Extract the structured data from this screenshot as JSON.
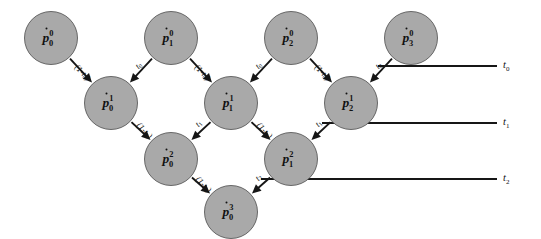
{
  "figure": {
    "name": "de-casteljau-recursion-diagram",
    "background_color": "#ffffff",
    "node_fill_color": "#a9a9a9",
    "node_stroke_color": "#5a5a5a",
    "line_color": "#161616",
    "node_radius": 26.5
  },
  "nodes": [
    {
      "id": "p00",
      "base": "p",
      "sub": "0",
      "sup": "0",
      "cx": 51,
      "cy": 38,
      "row": 0
    },
    {
      "id": "p10",
      "base": "p",
      "sub": "1",
      "sup": "0",
      "cx": 171,
      "cy": 38,
      "row": 0
    },
    {
      "id": "p20",
      "base": "p",
      "sub": "2",
      "sup": "0",
      "cx": 291,
      "cy": 38,
      "row": 0
    },
    {
      "id": "p30",
      "base": "p",
      "sub": "3",
      "sup": "0",
      "cx": 411,
      "cy": 38,
      "row": 0
    },
    {
      "id": "p01",
      "base": "p",
      "sub": "0",
      "sup": "1",
      "cx": 111,
      "cy": 103,
      "row": 1
    },
    {
      "id": "p11",
      "base": "p",
      "sub": "1",
      "sup": "1",
      "cx": 231,
      "cy": 103,
      "row": 1
    },
    {
      "id": "p21",
      "base": "p",
      "sub": "2",
      "sup": "1",
      "cx": 351,
      "cy": 103,
      "row": 1
    },
    {
      "id": "p02",
      "base": "p",
      "sub": "0",
      "sup": "2",
      "cx": 171,
      "cy": 159,
      "row": 2
    },
    {
      "id": "p12",
      "base": "p",
      "sub": "1",
      "sup": "2",
      "cx": 291,
      "cy": 159,
      "row": 2
    },
    {
      "id": "p03",
      "base": "p",
      "sub": "0",
      "sup": "3",
      "cx": 231,
      "cy": 212,
      "row": 3
    }
  ],
  "edges": [
    {
      "from": "p00",
      "to": "p01",
      "label_base": "(1-t",
      "label_sub": "0",
      "label_tail": ")",
      "lx": 82,
      "ly": 73,
      "rot": 46
    },
    {
      "from": "p10",
      "to": "p01",
      "label_base": "t",
      "label_sub": "0",
      "label_tail": "",
      "lx": 139,
      "ly": 66,
      "rot": -46
    },
    {
      "from": "p10",
      "to": "p11",
      "label_base": "(1-t",
      "label_sub": "0",
      "label_tail": ")",
      "lx": 202,
      "ly": 73,
      "rot": 46
    },
    {
      "from": "p20",
      "to": "p11",
      "label_base": "t",
      "label_sub": "0",
      "label_tail": "",
      "lx": 259,
      "ly": 66,
      "rot": -46
    },
    {
      "from": "p20",
      "to": "p21",
      "label_base": "(1-t",
      "label_sub": "0",
      "label_tail": ")",
      "lx": 322,
      "ly": 73,
      "rot": 46
    },
    {
      "from": "p30",
      "to": "p21",
      "label_base": "t",
      "label_sub": "0",
      "label_tail": "",
      "lx": 379,
      "ly": 66,
      "rot": -46
    },
    {
      "from": "p01",
      "to": "p02",
      "label_base": "(1-t",
      "label_sub": "1",
      "label_tail": ")",
      "lx": 144,
      "ly": 131,
      "rot": 46
    },
    {
      "from": "p11",
      "to": "p02",
      "label_base": "t",
      "label_sub": "1",
      "label_tail": "",
      "lx": 199,
      "ly": 124,
      "rot": -46
    },
    {
      "from": "p11",
      "to": "p12",
      "label_base": "(1-t",
      "label_sub": "1",
      "label_tail": ")",
      "lx": 264,
      "ly": 131,
      "rot": 46
    },
    {
      "from": "p21",
      "to": "p12",
      "label_base": "t",
      "label_sub": "1",
      "label_tail": "",
      "lx": 319,
      "ly": 124,
      "rot": -46
    },
    {
      "from": "p02",
      "to": "p03",
      "label_base": "(1-t",
      "label_sub": "2",
      "label_tail": ")",
      "lx": 203,
      "ly": 185,
      "rot": 46
    },
    {
      "from": "p12",
      "to": "p03",
      "label_base": "t",
      "label_sub": "2",
      "label_tail": "",
      "lx": 259,
      "ly": 178,
      "rot": -46
    }
  ],
  "rails": [
    {
      "id": "rail-t0",
      "base": "t",
      "sub": "0",
      "x1": 378,
      "x2": 497,
      "y": 66,
      "label_x": 503,
      "label_y": 66
    },
    {
      "id": "rail-t1",
      "base": "t",
      "sub": "1",
      "x1": 322,
      "x2": 497,
      "y": 123,
      "label_x": 503,
      "label_y": 123
    },
    {
      "id": "rail-t2",
      "base": "t",
      "sub": "2",
      "x1": 261,
      "x2": 497,
      "y": 179,
      "label_x": 503,
      "label_y": 179
    }
  ]
}
